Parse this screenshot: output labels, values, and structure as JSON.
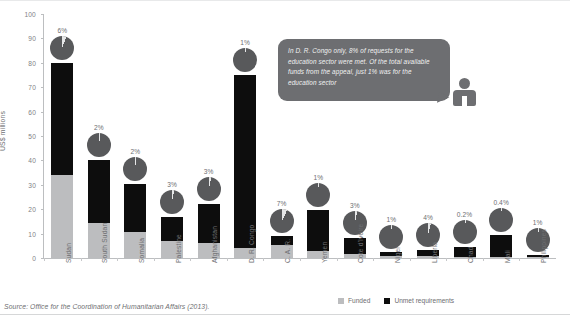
{
  "chart_data": {
    "type": "bar",
    "subtype": "stacked-bar-with-pie-markers",
    "title": "",
    "xlabel": "",
    "ylabel": "US$ millions",
    "ylim": [
      0,
      100
    ],
    "yticks": [
      0,
      10,
      20,
      30,
      40,
      50,
      60,
      70,
      80,
      90,
      100
    ],
    "grid": false,
    "legend_position": "bottom-right",
    "categories": [
      "Sudan",
      "South Sudan",
      "Somalia",
      "Palestine",
      "Afghanistan",
      "D. R. Congo",
      "C. A. R.",
      "Yemen",
      "Cote d'Ivoire",
      "Niger",
      "Liberia",
      "Chad",
      "Mali",
      "Philippines"
    ],
    "series": [
      {
        "name": "Funded",
        "color": "#bcbdbf",
        "values": [
          34.0,
          14.5,
          10.5,
          7.0,
          6.0,
          4.0,
          5.5,
          3.0,
          1.5,
          1.0,
          0.8,
          0.6,
          0.5,
          0.4
        ]
      },
      {
        "name": "Unmet requirements",
        "color": "#0d0d0d",
        "values": [
          46.0,
          25.5,
          20.0,
          10.0,
          16.0,
          71.0,
          3.5,
          16.5,
          6.5,
          1.5,
          2.5,
          3.8,
          9.0,
          1.0
        ]
      }
    ],
    "totals": [
      80.0,
      40.0,
      30.5,
      17.0,
      22.0,
      75.0,
      9.0,
      19.5,
      8.0,
      2.5,
      3.3,
      4.4,
      9.5,
      1.4
    ],
    "pie_labels": [
      "6%",
      "2%",
      "2%",
      "3%",
      "3%",
      "1%",
      "7%",
      "1%",
      "3%",
      "1%",
      "4%",
      "0.2%",
      "0.4%",
      "1%"
    ],
    "pie_values": [
      6,
      2,
      2,
      3,
      3,
      1,
      7,
      1,
      3,
      1,
      4,
      0.2,
      0.4,
      1
    ],
    "pie_note": "Share of appeal funds allocated to the education sector"
  },
  "legend": {
    "items": [
      {
        "label": "Funded",
        "color": "#bcbdbf"
      },
      {
        "label": "Unmet requirements",
        "color": "#0d0d0d"
      }
    ]
  },
  "callout": {
    "text": "In D. R. Congo only, 8% of requests for the education sector were met. Of the total available funds from the appeal, just 1% was for the education sector"
  },
  "source": {
    "text": "Source: Office for the Coordination of Humanitarian Affairs (2013)."
  }
}
